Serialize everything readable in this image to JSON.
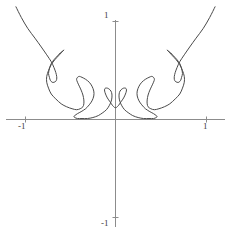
{
  "figure": {
    "name": "parametric-curve-plot",
    "background_color": "#ffffff"
  },
  "axes": {
    "axis_color": "#8c8c8c",
    "x_axis": {
      "label_left": "-1",
      "label_right": "1",
      "ticks": [
        -1,
        1
      ]
    },
    "y_axis": {
      "label_top": "1",
      "label_bottom": "-1",
      "ticks": [
        -1,
        1
      ]
    }
  },
  "curve": {
    "stroke_color": "#4a4a4a",
    "stroke_width": 1
  },
  "chart_data": {
    "type": "line",
    "title": "",
    "xlabel": "",
    "ylabel": "",
    "xlim": [
      -1.25,
      1.25
    ],
    "ylim": [
      -1.25,
      1.25
    ],
    "grid": false,
    "legend": null,
    "symmetry": "about y-axis",
    "xtick_labels": [
      "-1",
      "1"
    ],
    "ytick_labels": [
      "-1",
      "1"
    ],
    "xticks": [
      -1,
      1
    ],
    "yticks": [
      -1,
      1
    ],
    "series": [
      {
        "name": "curve",
        "x": [
          -1.1,
          -1.04,
          -0.97,
          -0.89,
          -0.82,
          -0.76,
          -0.71,
          -0.68,
          -0.66,
          -0.65,
          -0.65,
          -0.66,
          -0.68,
          -0.7,
          -0.72,
          -0.73,
          -0.74,
          -0.73,
          -0.71,
          -0.68,
          -0.64,
          -0.61,
          -0.58,
          -0.57,
          -0.58,
          -0.6,
          -0.63,
          -0.67,
          -0.71,
          -0.74,
          -0.76,
          -0.76,
          -0.74,
          -0.71,
          -0.66,
          -0.6,
          -0.54,
          -0.48,
          -0.43,
          -0.39,
          -0.36,
          -0.35,
          -0.35,
          -0.36,
          -0.38,
          -0.4,
          -0.42,
          -0.43,
          -0.42,
          -0.4,
          -0.37,
          -0.33,
          -0.29,
          -0.26,
          -0.24,
          -0.24,
          -0.26,
          -0.29,
          -0.33,
          -0.38,
          -0.42,
          -0.45,
          -0.46,
          -0.45,
          -0.42,
          -0.37,
          -0.31,
          -0.25,
          -0.19,
          -0.14,
          -0.1,
          -0.07,
          -0.05,
          -0.04,
          -0.04,
          -0.05,
          -0.07,
          -0.09,
          -0.11,
          -0.12,
          -0.12,
          -0.11,
          -0.09,
          -0.06,
          -0.03,
          0.0,
          0.03,
          0.06,
          0.09,
          0.11,
          0.12,
          0.12,
          0.11,
          0.09,
          0.07,
          0.05,
          0.04,
          0.04,
          0.05,
          0.07,
          0.1,
          0.14,
          0.19,
          0.25,
          0.31,
          0.37,
          0.42,
          0.45,
          0.46,
          0.45,
          0.42,
          0.38,
          0.33,
          0.29,
          0.26,
          0.24,
          0.24,
          0.26,
          0.29,
          0.33,
          0.37,
          0.4,
          0.42,
          0.43,
          0.42,
          0.4,
          0.38,
          0.36,
          0.35,
          0.35,
          0.36,
          0.39,
          0.43,
          0.48,
          0.54,
          0.6,
          0.66,
          0.71,
          0.74,
          0.76,
          0.76,
          0.74,
          0.71,
          0.67,
          0.63,
          0.6,
          0.58,
          0.57,
          0.58,
          0.61,
          0.64,
          0.68,
          0.71,
          0.73,
          0.74,
          0.73,
          0.72,
          0.7,
          0.68,
          0.66,
          0.65,
          0.65,
          0.66,
          0.68,
          0.71,
          0.76,
          0.82,
          0.89,
          0.97,
          1.04,
          1.1
        ],
        "y": [
          1.15,
          1.04,
          0.93,
          0.83,
          0.74,
          0.66,
          0.59,
          0.53,
          0.48,
          0.44,
          0.41,
          0.39,
          0.38,
          0.38,
          0.4,
          0.43,
          0.47,
          0.52,
          0.57,
          0.61,
          0.65,
          0.68,
          0.7,
          0.71,
          0.7,
          0.68,
          0.65,
          0.61,
          0.56,
          0.5,
          0.44,
          0.38,
          0.32,
          0.26,
          0.21,
          0.16,
          0.13,
          0.11,
          0.1,
          0.11,
          0.13,
          0.16,
          0.2,
          0.25,
          0.3,
          0.34,
          0.38,
          0.41,
          0.43,
          0.44,
          0.43,
          0.41,
          0.38,
          0.34,
          0.29,
          0.24,
          0.19,
          0.15,
          0.11,
          0.08,
          0.06,
          0.04,
          0.03,
          0.02,
          0.01,
          0.01,
          0.01,
          0.02,
          0.04,
          0.07,
          0.1,
          0.14,
          0.18,
          0.22,
          0.26,
          0.29,
          0.31,
          0.32,
          0.32,
          0.31,
          0.29,
          0.26,
          0.22,
          0.18,
          0.14,
          0.12,
          0.14,
          0.18,
          0.22,
          0.26,
          0.29,
          0.31,
          0.32,
          0.32,
          0.31,
          0.29,
          0.26,
          0.22,
          0.18,
          0.14,
          0.1,
          0.07,
          0.04,
          0.02,
          0.01,
          0.01,
          0.01,
          0.02,
          0.03,
          0.04,
          0.06,
          0.08,
          0.11,
          0.15,
          0.19,
          0.24,
          0.29,
          0.34,
          0.38,
          0.41,
          0.43,
          0.44,
          0.43,
          0.41,
          0.38,
          0.34,
          0.3,
          0.25,
          0.2,
          0.16,
          0.13,
          0.11,
          0.1,
          0.11,
          0.13,
          0.16,
          0.21,
          0.26,
          0.32,
          0.38,
          0.44,
          0.5,
          0.56,
          0.61,
          0.65,
          0.68,
          0.7,
          0.71,
          0.7,
          0.68,
          0.65,
          0.61,
          0.57,
          0.52,
          0.47,
          0.43,
          0.4,
          0.38,
          0.38,
          0.39,
          0.41,
          0.44,
          0.48,
          0.53,
          0.59,
          0.66,
          0.74,
          0.83,
          0.93,
          1.04,
          1.15
        ]
      }
    ]
  }
}
